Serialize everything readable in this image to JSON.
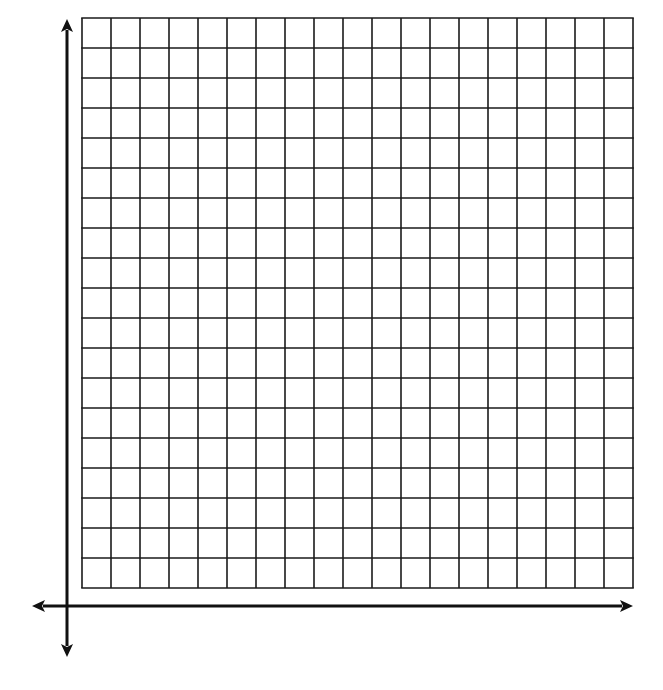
{
  "diagram": {
    "type": "blank-coordinate-grid",
    "colors": {
      "background": "#ffffff",
      "grid_line": "#1a1a1a",
      "axis": "#111111"
    },
    "grid": {
      "columns": 19,
      "rows": 19,
      "left": 82,
      "top": 18,
      "cell_width": 29,
      "cell_height": 30,
      "line_width": 1.6
    },
    "axes": {
      "x_axis": {
        "y": 606,
        "x_start": 32,
        "x_end": 633,
        "arrows": [
          "left",
          "right"
        ]
      },
      "y_axis": {
        "x": 67,
        "y_start": 19,
        "y_end": 657,
        "arrows": [
          "up",
          "down"
        ]
      },
      "line_width": 3
    }
  }
}
